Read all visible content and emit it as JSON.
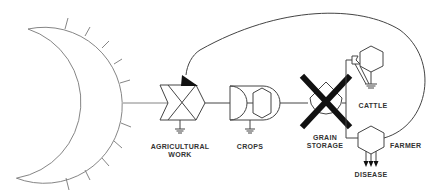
{
  "diagram": {
    "title": "",
    "colors": {
      "line": "#444444",
      "source_line": "#777777",
      "fill_dark": "#111111",
      "label": "#333333",
      "background": "#ffffff"
    },
    "nodes": [
      {
        "id": "energy-source",
        "type": "source-circle",
        "label": ""
      },
      {
        "id": "agricultural-work",
        "type": "work-gate",
        "label_lines": [
          "AGRICULTURAL",
          "WORK"
        ]
      },
      {
        "id": "crops",
        "type": "producer",
        "label_lines": [
          "CROPS"
        ]
      },
      {
        "id": "grain-storage",
        "type": "storage-crossed",
        "label_lines": [
          "GRAIN",
          "STORAGE"
        ]
      },
      {
        "id": "cattle",
        "type": "consumer-hexagon",
        "label_lines": [
          "CATTLE"
        ]
      },
      {
        "id": "farmer",
        "type": "consumer-hexagon",
        "label_lines": [
          "FARMER"
        ]
      },
      {
        "id": "disease",
        "type": "outflow-arrows",
        "label_lines": [
          "DISEASE"
        ]
      }
    ],
    "edges": [
      {
        "from": "energy-source",
        "to": "agricultural-work"
      },
      {
        "from": "agricultural-work",
        "to": "crops"
      },
      {
        "from": "crops",
        "to": "grain-storage"
      },
      {
        "from": "grain-storage",
        "to": "cattle"
      },
      {
        "from": "grain-storage",
        "to": "farmer"
      },
      {
        "from": "farmer",
        "to": "agricultural-work",
        "style": "feedback-curve"
      },
      {
        "from": "farmer",
        "to": "disease"
      }
    ],
    "labels": {
      "agricultural_work_1": "AGRICULTURAL",
      "agricultural_work_2": "WORK",
      "crops": "CROPS",
      "grain_storage_1": "GRAIN",
      "grain_storage_2": "STORAGE",
      "cattle": "CATTLE",
      "farmer": "FARMER",
      "disease": "DISEASE"
    }
  }
}
